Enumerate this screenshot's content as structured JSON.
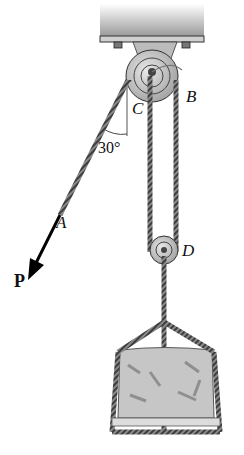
{
  "figure": {
    "type": "pulley-system-diagram",
    "labels": {
      "B": "B",
      "C": "C",
      "D": "D",
      "A": "A",
      "force": "P",
      "angle": "30°"
    },
    "colors": {
      "rope": "#6b6b6b",
      "pulley": "#bdbdbd",
      "plate": "#d0d0d0",
      "load": "#c8c8c8",
      "arrow": "#000000"
    }
  }
}
